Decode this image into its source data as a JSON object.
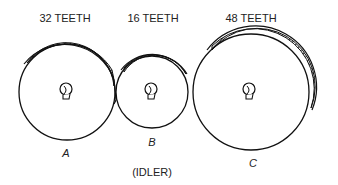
{
  "diagram": {
    "type": "gear train",
    "gears": [
      {
        "id": "A",
        "teeth_label": "32 TEETH",
        "letter": "A",
        "teeth": 32
      },
      {
        "id": "B",
        "teeth_label": "16 TEETH",
        "letter": "B",
        "teeth": 16,
        "note": "(IDLER)"
      },
      {
        "id": "C",
        "teeth_label": "48 TEETH",
        "letter": "C",
        "teeth": 48
      }
    ],
    "colors": {
      "stroke": "#111111",
      "text": "#222222",
      "background": "#ffffff"
    }
  }
}
